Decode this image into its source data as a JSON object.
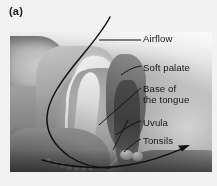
{
  "figure": {
    "panel_label": "(a)",
    "type": "anatomical-illustration",
    "colors": {
      "line": "#111111",
      "text": "#161616",
      "background": "#f2f2f2",
      "plate_light": "#efefef",
      "plate_mid": "#9a9a9a",
      "plate_dark": "#5c5c5c"
    }
  },
  "labels": [
    {
      "id": "airflow",
      "text": "Airflow"
    },
    {
      "id": "soft_palate",
      "text": "Soft palate"
    },
    {
      "id": "base_tongue",
      "line1": "Base of",
      "line2": "the tongue"
    },
    {
      "id": "uvula",
      "text": "Uvula"
    },
    {
      "id": "tonsils",
      "text": "Tonsils"
    }
  ],
  "annotations": {
    "airflow_curve": "curved black line tracing the airway from the nose down through the pharynx",
    "arrowhead": "arrow pointing right at the lower pharynx indicating direction of airflow"
  }
}
